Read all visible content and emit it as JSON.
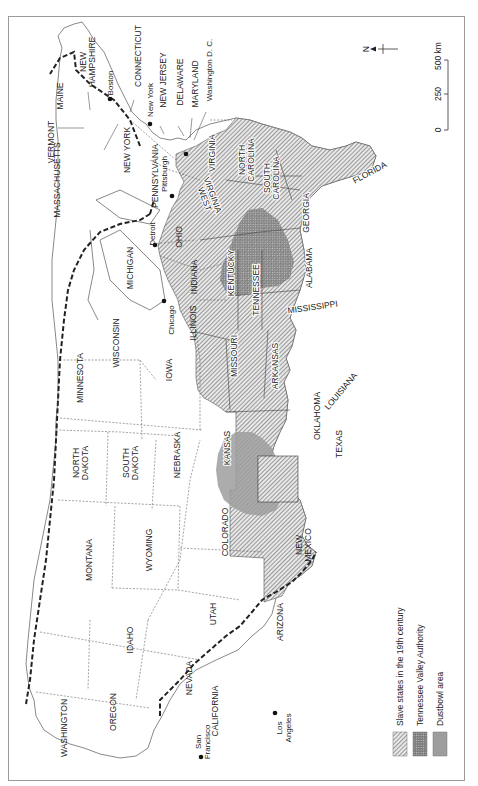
{
  "map": {
    "orientation": "rotated 90deg clockwise (north arrow points left)",
    "north_label": "N",
    "scale_bar": {
      "ticks": [
        "0",
        "250",
        "500 km"
      ]
    },
    "states": {
      "washington": "WASHINGTON",
      "oregon": "OREGON",
      "california": "CALIFORNIA",
      "idaho": "IDAHO",
      "nevada": "NEVADA",
      "montana": "MONTANA",
      "wyoming": "WYOMING",
      "utah": "UTAH",
      "arizona": "ARIZONA",
      "colorado": "COLORADO",
      "new_mexico_1": "NEW",
      "new_mexico_2": "MEXICO",
      "north_dakota_1": "NORTH",
      "north_dakota_2": "DAKOTA",
      "south_dakota_1": "SOUTH",
      "south_dakota_2": "DAKOTA",
      "nebraska": "NEBRASKA",
      "kansas": "KANSAS",
      "oklahoma": "OKLAHOMA",
      "texas": "TEXAS",
      "minnesota": "MINNESOTA",
      "iowa": "IOWA",
      "missouri": "MISSOURI",
      "arkansas": "ARKANSAS",
      "louisiana": "LOUISIANA",
      "wisconsin": "WISCONSIN",
      "illinois": "ILLINOIS",
      "michigan": "MICHIGAN",
      "indiana": "INDIANA",
      "ohio": "OHIO",
      "kentucky": "KENTUCKY",
      "tennessee": "TENNESSEE",
      "mississippi": "MISSISSIPPI",
      "alabama": "ALABAMA",
      "georgia": "GEORGIA",
      "florida": "FLORIDA",
      "south_carolina_1": "SOUTH",
      "south_carolina_2": "CAROLINA",
      "north_carolina_1": "NORTH",
      "north_carolina_2": "CAROLINA",
      "virginia": "VIRGINIA",
      "west_virginia_1": "WEST",
      "west_virginia_2": "VIRGINIA",
      "pennsylvania": "PENNSYLVANIA",
      "new_york": "NEW YORK",
      "vermont": "VERMONT",
      "massachusetts": "MASSACHUSETTS",
      "maine": "MAINE",
      "new_hampshire_1": "NEW",
      "new_hampshire_2": "HAMPSHIRE",
      "connecticut": "CONNECTICUT",
      "new_jersey": "NEW JERSEY",
      "delaware": "DELAWARE",
      "maryland": "MARYLAND"
    },
    "cities": {
      "boston": "Boston",
      "new_york": "New York",
      "washington_dc": "Washington D. C.",
      "pittsburgh": "Pittsburgh",
      "detroit": "Detroit",
      "chicago": "Chicago",
      "san_francisco_1": "San",
      "san_francisco_2": "Francisco",
      "los_angeles_1": "Los",
      "los_angeles_2": "Angeles"
    },
    "legend": {
      "items": [
        {
          "label": "Slave states in the 19th century",
          "pattern": "diagonal-hatch"
        },
        {
          "label": "Tennessee Valley Authority",
          "pattern": "dotted"
        },
        {
          "label": "Dustbowl area",
          "pattern": "solid-gray",
          "color": "#9d9d9d"
        }
      ]
    }
  }
}
